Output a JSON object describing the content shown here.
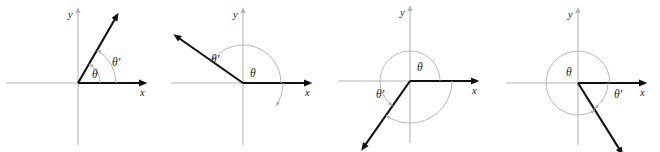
{
  "figure": {
    "background_color": "#ffffff",
    "axis_color": "#b5b5b5",
    "ray_color": "#111111",
    "arc_color": "#b0b0b0",
    "width": 660,
    "height": 152
  },
  "labels": {
    "x_axis": "x",
    "y_axis": "y",
    "theta": "θ",
    "theta_prime": "θ′"
  },
  "panels": [
    {
      "id": "panel-1",
      "index": 1,
      "origin": {
        "x": 78,
        "y": 83
      },
      "x_axis_label": "x",
      "y_axis_label": "y",
      "terminal_ray": {
        "angle_deg": 60,
        "length": 74,
        "quadrant": 1
      },
      "initial_ray": {
        "angle_deg": 0,
        "length": 62
      },
      "theta": {
        "label": "θ",
        "value_deg": 60,
        "direction": "counterclockwise",
        "arc_radius": 22,
        "label_x": 92,
        "label_y": 78
      },
      "theta_prime": {
        "label": "θ′",
        "value_deg": 60,
        "direction": "counterclockwise",
        "arc_radius": 38,
        "label_x": 112,
        "label_y": 66
      }
    },
    {
      "id": "panel-2",
      "index": 2,
      "origin": {
        "x": 243,
        "y": 83
      },
      "x_axis_label": "x",
      "y_axis_label": "y",
      "terminal_ray": {
        "angle_deg": 145,
        "length": 78,
        "quadrant": 2
      },
      "initial_ray": {
        "angle_deg": 0,
        "length": 62
      },
      "theta": {
        "label": "θ",
        "value_deg": 145,
        "direction": "counterclockwise",
        "arc_radius": 38,
        "label_x": 250,
        "label_y": 77
      },
      "theta_prime": {
        "label": "θ′",
        "value_deg": -35,
        "direction": "clockwise",
        "arc_radius": 40,
        "label_x": 211,
        "label_y": 63
      }
    },
    {
      "id": "panel-3",
      "index": 3,
      "origin": {
        "x": 410,
        "y": 81
      },
      "x_axis_label": "x",
      "y_axis_label": "y",
      "terminal_ray": {
        "angle_deg": 235,
        "length": 78,
        "quadrant": 3
      },
      "initial_ray": {
        "angle_deg": 0,
        "length": 62
      },
      "theta": {
        "label": "θ",
        "value_deg": 235,
        "direction": "counterclockwise",
        "arc_radius": 30,
        "label_x": 417,
        "label_y": 71
      },
      "theta_prime": {
        "label": "θ′",
        "value_deg": -125,
        "direction": "clockwise",
        "arc_radius": 42,
        "label_x": 376,
        "label_y": 98
      }
    },
    {
      "id": "panel-4",
      "index": 4,
      "origin": {
        "x": 578,
        "y": 83
      },
      "x_axis_label": "x",
      "y_axis_label": "y",
      "terminal_ray": {
        "angle_deg": -58,
        "length": 78,
        "quadrant": 4
      },
      "initial_ray": {
        "angle_deg": 0,
        "length": 62
      },
      "theta": {
        "label": "θ",
        "value_deg": 302,
        "direction": "counterclockwise",
        "arc_radius": 32,
        "label_x": 566,
        "label_y": 76
      },
      "theta_prime": {
        "label": "θ′",
        "value_deg": -58,
        "direction": "clockwise",
        "arc_radius": 30,
        "label_x": 614,
        "label_y": 98
      }
    }
  ]
}
